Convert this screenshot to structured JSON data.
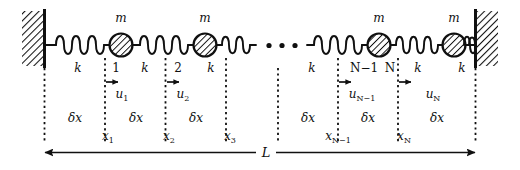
{
  "figure": {
    "type": "mass-spring-chain-diagram",
    "background_color": "#ffffff",
    "ink_color": "#101010"
  },
  "labels": {
    "mass": "m",
    "spring": "k",
    "length": "L",
    "cell": "δx",
    "ellipsis": "· · ·"
  },
  "masses": [
    {
      "id": "mass-1",
      "mass_label": "m",
      "index": "1",
      "displacement": "u",
      "displacement_sub": "1",
      "position": "x",
      "position_sub": "1"
    },
    {
      "id": "mass-2",
      "mass_label": "m",
      "index": "2",
      "displacement": "u",
      "displacement_sub": "2",
      "position": "x",
      "position_sub": "2"
    },
    {
      "id": "mass-n-1",
      "mass_label": "m",
      "index": "N−1",
      "displacement": "u",
      "displacement_sub": "N−1",
      "position": "x",
      "position_sub": "N−1"
    },
    {
      "id": "mass-n",
      "mass_label": "m",
      "index": "N",
      "displacement": "u",
      "displacement_sub": "N",
      "position": "x",
      "position_sub": "N"
    }
  ],
  "springs": [
    {
      "id": "spring-0",
      "stiffness_label": "k"
    },
    {
      "id": "spring-1",
      "stiffness_label": "k"
    },
    {
      "id": "spring-2",
      "stiffness_label": "k"
    },
    {
      "id": "spring-3",
      "stiffness_label": "k"
    },
    {
      "id": "spring-4",
      "stiffness_label": "k"
    },
    {
      "id": "spring-5",
      "stiffness_label": "k"
    }
  ],
  "cells": [
    {
      "id": "cell-0",
      "label": "δx"
    },
    {
      "id": "cell-1",
      "label": "δx"
    },
    {
      "id": "cell-2",
      "label": "δx"
    },
    {
      "id": "cell-3",
      "label": "δx"
    },
    {
      "id": "cell-4",
      "label": "δx"
    },
    {
      "id": "cell-5",
      "label": "δx"
    }
  ],
  "positions": [
    {
      "id": "pos-1",
      "symbol": "x",
      "sub": "1"
    },
    {
      "id": "pos-2",
      "symbol": "x",
      "sub": "2"
    },
    {
      "id": "pos-3",
      "symbol": "x",
      "sub": "3"
    },
    {
      "id": "pos-n-1",
      "symbol": "x",
      "sub": "N−1"
    },
    {
      "id": "pos-n",
      "symbol": "x",
      "sub": "N"
    }
  ],
  "displacements": [
    {
      "id": "disp-1",
      "symbol": "u",
      "sub": "1"
    },
    {
      "id": "disp-2",
      "symbol": "u",
      "sub": "2"
    },
    {
      "id": "disp-n-1",
      "symbol": "u",
      "sub": "N−1"
    },
    {
      "id": "disp-n",
      "symbol": "u",
      "sub": "N"
    }
  ],
  "walls": [
    {
      "id": "wall-left",
      "name": "fixed-wall-left"
    },
    {
      "id": "wall-right",
      "name": "fixed-wall-right"
    }
  ],
  "total_length": {
    "symbol": "L",
    "name": "total-chain-length"
  }
}
